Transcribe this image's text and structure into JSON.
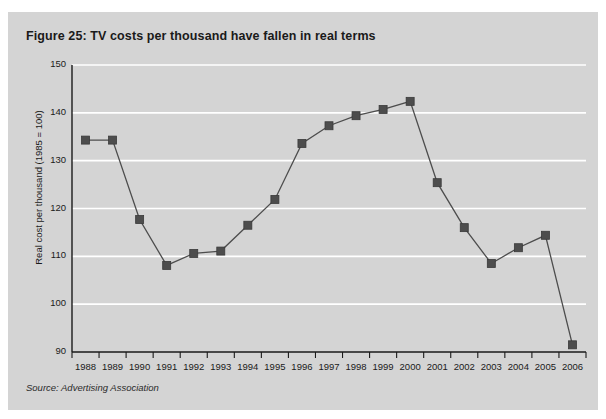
{
  "figure": {
    "title": "Figure 25: TV costs per thousand have fallen in real terms",
    "source": "Source: Advertising Association"
  },
  "chart_data": {
    "type": "line",
    "title": "Figure 25: TV costs per thousand have fallen in real terms",
    "subtitle": "",
    "xlabel": "",
    "ylabel": "Real cost per thousand (1985 = 100)",
    "categories": [
      "1988",
      "1989",
      "1990",
      "1991",
      "1992",
      "1993",
      "1994",
      "1995",
      "1996",
      "1997",
      "1998",
      "1999",
      "2000",
      "2001",
      "2002",
      "2003",
      "2004",
      "2005",
      "2006"
    ],
    "values": [
      134.3,
      134.3,
      117.7,
      108.1,
      110.6,
      111.1,
      116.5,
      121.9,
      133.6,
      137.3,
      139.4,
      140.7,
      142.4,
      125.4,
      116.0,
      108.5,
      111.8,
      114.4,
      91.5
    ],
    "ylim": [
      90,
      150
    ],
    "yticks": [
      90,
      100,
      110,
      120,
      130,
      140,
      150
    ],
    "ytick_labels": [
      "90",
      "100",
      "110",
      "120",
      "130",
      "140",
      "150"
    ],
    "grid": true,
    "grid_color": "#ffffff",
    "legend": false,
    "legend_position": "none",
    "marker": "square",
    "marker_color": "#4d4d4d",
    "line_color": "#4d4d4d",
    "plot_background": "#d4d4d4",
    "axis_color": "#1a1a1a",
    "annotations": [
      "Source: Advertising Association"
    ]
  }
}
